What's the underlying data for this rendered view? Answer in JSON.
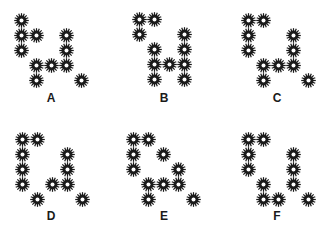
{
  "figure": {
    "dot_color": "#1a1a1a",
    "grid": {
      "cols": 5,
      "rows": 5,
      "spacing": 15
    },
    "panels": [
      {
        "label": "A",
        "origin": [
          21,
          20
        ],
        "label_pos": [
          51,
          92
        ],
        "cells": [
          [
            0,
            0
          ],
          [
            1,
            0
          ],
          [
            1,
            1
          ],
          [
            1,
            3
          ],
          [
            2,
            0
          ],
          [
            2,
            3
          ],
          [
            3,
            1
          ],
          [
            3,
            2
          ],
          [
            3,
            3
          ],
          [
            4,
            1
          ],
          [
            4,
            4
          ]
        ]
      },
      {
        "label": "B",
        "origin": [
          139,
          19
        ],
        "label_pos": [
          164,
          92
        ],
        "cells": [
          [
            0,
            0
          ],
          [
            0,
            1
          ],
          [
            1,
            0
          ],
          [
            1,
            3
          ],
          [
            2,
            1
          ],
          [
            2,
            3
          ],
          [
            3,
            1
          ],
          [
            3,
            2
          ],
          [
            3,
            3
          ],
          [
            4,
            1
          ],
          [
            4,
            3
          ]
        ]
      },
      {
        "label": "C",
        "origin": [
          248,
          20
        ],
        "label_pos": [
          277,
          92
        ],
        "cells": [
          [
            0,
            0
          ],
          [
            0,
            1
          ],
          [
            1,
            0
          ],
          [
            1,
            3
          ],
          [
            2,
            0
          ],
          [
            2,
            3
          ],
          [
            3,
            1
          ],
          [
            3,
            2
          ],
          [
            3,
            3
          ],
          [
            4,
            1
          ],
          [
            4,
            4
          ]
        ]
      },
      {
        "label": "D",
        "origin": [
          22,
          139
        ],
        "label_pos": [
          51,
          210
        ],
        "cells": [
          [
            0,
            0
          ],
          [
            0,
            1
          ],
          [
            1,
            0
          ],
          [
            1,
            3
          ],
          [
            2,
            0
          ],
          [
            2,
            3
          ],
          [
            3,
            0
          ],
          [
            3,
            2
          ],
          [
            3,
            3
          ],
          [
            4,
            1
          ],
          [
            4,
            4
          ]
        ]
      },
      {
        "label": "E",
        "origin": [
          133,
          139
        ],
        "label_pos": [
          164,
          210
        ],
        "cells": [
          [
            0,
            0
          ],
          [
            0,
            1
          ],
          [
            1,
            0
          ],
          [
            1,
            2
          ],
          [
            2,
            0
          ],
          [
            2,
            3
          ],
          [
            3,
            1
          ],
          [
            3,
            2
          ],
          [
            3,
            3
          ],
          [
            4,
            1
          ],
          [
            4,
            4
          ]
        ]
      },
      {
        "label": "F",
        "origin": [
          248,
          139
        ],
        "label_pos": [
          277,
          210
        ],
        "cells": [
          [
            0,
            0
          ],
          [
            0,
            1
          ],
          [
            1,
            0
          ],
          [
            1,
            3
          ],
          [
            2,
            0
          ],
          [
            2,
            3
          ],
          [
            3,
            1
          ],
          [
            3,
            3
          ],
          [
            4,
            1
          ],
          [
            4,
            2
          ],
          [
            4,
            4
          ]
        ]
      }
    ]
  }
}
